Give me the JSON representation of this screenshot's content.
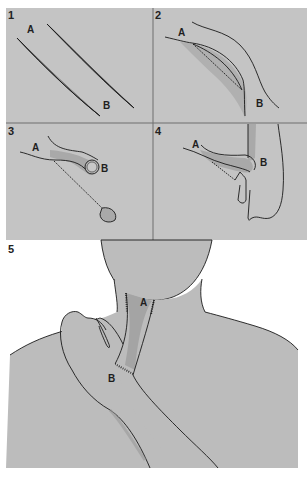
{
  "figure": {
    "colors": {
      "panel_bg": "#c4c4c4",
      "skin": "#bcbcbc",
      "flap": "#a9a9a9",
      "flap_dark": "#999999",
      "line": "#1a1a1a",
      "divider": "#6e6e6e",
      "page": "#ffffff"
    },
    "panels": [
      {
        "number": "1",
        "labels": [
          "A",
          "B"
        ],
        "description": "Two parallel diagonal incisions outlining a tube pedicle"
      },
      {
        "number": "2",
        "labels": [
          "A",
          "B"
        ],
        "description": "Skin strip raised and tubed; donor site sutured"
      },
      {
        "number": "3",
        "labels": [
          "A",
          "B"
        ],
        "description": "End B detached, tube pedicle free at B"
      },
      {
        "number": "4",
        "labels": [
          "A",
          "B"
        ],
        "description": "End B attached to wrist (carrier)"
      },
      {
        "number": "5",
        "labels": [
          "A",
          "B"
        ],
        "description": "Tube pedicle transferred from wrist to neck"
      }
    ]
  }
}
